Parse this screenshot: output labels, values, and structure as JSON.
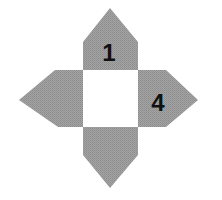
{
  "diagram": {
    "type": "cube-net",
    "colors": {
      "flap_fill": "#9b9b9b",
      "center_fill": "#ffffff",
      "label_color": "#111111"
    },
    "center_square": {
      "x": 83,
      "y": 70,
      "w": 55,
      "h": 57
    },
    "flaps": [
      {
        "id": "top",
        "label": "1",
        "points": "83,70 83,42 110,8 138,42 138,70",
        "label_pos": {
          "x": 109,
          "y": 61
        }
      },
      {
        "id": "left",
        "label": "",
        "points": "83,70 55,70 19,100 58,127 83,127",
        "label_pos": null
      },
      {
        "id": "right",
        "label": "4",
        "points": "138,70 166,70 198,100 166,127 138,127",
        "label_pos": {
          "x": 158,
          "y": 111
        }
      },
      {
        "id": "bottom",
        "label": "",
        "points": "83,127 83,155 110,188 138,155 138,127",
        "label_pos": null
      }
    ],
    "labels": {
      "top": "1",
      "right": "4"
    }
  }
}
